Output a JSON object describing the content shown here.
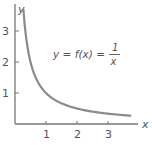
{
  "chart_data": {
    "type": "line",
    "title": "",
    "xlabel": "x",
    "ylabel": "y",
    "xlim": [
      0,
      4.0
    ],
    "ylim": [
      0,
      3.8
    ],
    "x_ticks": [
      1,
      2,
      3
    ],
    "y_ticks": [
      1,
      2,
      3
    ],
    "x_tick_labels": [
      "1",
      "2",
      "3"
    ],
    "y_tick_labels": [
      "1",
      "2",
      "3"
    ],
    "grid": false,
    "legend": null,
    "series": [
      {
        "name": "y = f(x) = 1/x",
        "function": "1/x",
        "x_range": [
          0.27,
          3.75
        ],
        "x": [
          0.27,
          0.3,
          0.4,
          0.5,
          0.6,
          0.75,
          1.0,
          1.25,
          1.5,
          2.0,
          2.5,
          3.0,
          3.5,
          3.75
        ],
        "values": [
          3.7,
          3.33,
          2.5,
          2.0,
          1.67,
          1.33,
          1.0,
          0.8,
          0.67,
          0.5,
          0.4,
          0.33,
          0.29,
          0.27
        ],
        "color": "#8a8a8a"
      }
    ],
    "annotations": [
      {
        "text": "y = f(x) = 1/x",
        "x": 1.5,
        "y": 2.0
      }
    ]
  },
  "labels": {
    "x_axis": "x",
    "y_axis": "y",
    "equation_lhs": "y = f(x) =",
    "equation_num": "1",
    "equation_den": "x"
  },
  "colors": {
    "axis": "#777777",
    "curve": "#8a8a8a",
    "text": "#555555"
  }
}
